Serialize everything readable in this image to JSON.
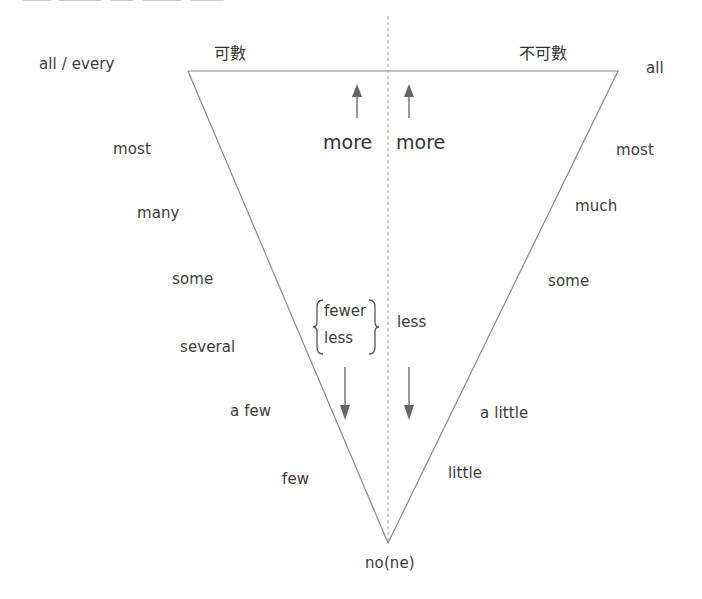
{
  "diagram": {
    "type": "inverted-triangle quantifier scale",
    "colors": {
      "line": "#8a8a8a",
      "arrow": "#6a6a6a",
      "text": "#3c3c3c",
      "dashed": "#9a9a9a"
    },
    "headers": {
      "countable": "可數",
      "uncountable": "不可數"
    },
    "left_scale": {
      "top": "all / every",
      "items": [
        "most",
        "many",
        "some",
        "several",
        "a few",
        "few"
      ]
    },
    "right_scale": {
      "top": "all",
      "items": [
        "most",
        "much",
        "some",
        "a little",
        "little"
      ]
    },
    "bottom": "no(ne)",
    "center": {
      "left_more": "more",
      "right_more": "more",
      "left_less_options": [
        "fewer",
        "less"
      ],
      "right_less": "less"
    }
  }
}
